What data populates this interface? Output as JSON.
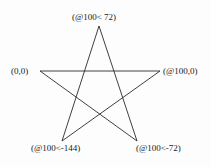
{
  "diagram": {
    "type": "pentagram",
    "stroke_color": "#2a2a2a",
    "labels": {
      "top": "(@100< 72)",
      "left": "(0,0)",
      "right": "(@100,0)",
      "bottom_left": "(@100<-144)",
      "bottom_right": "(@100<-72)"
    },
    "vertices": {
      "top": [
        99,
        26
      ],
      "left": [
        40,
        71
      ],
      "right": [
        160,
        71
      ],
      "bottom_left": [
        62,
        141
      ],
      "bottom_right": [
        137,
        141
      ]
    }
  }
}
